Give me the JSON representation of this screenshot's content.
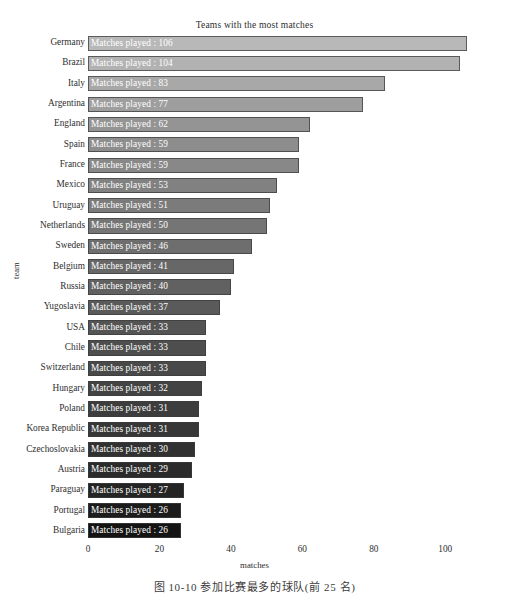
{
  "chart_data": {
    "type": "bar",
    "orientation": "horizontal",
    "title": "Teams with the most matches",
    "xlabel": "matches",
    "ylabel": "team",
    "xlim": [
      0,
      110
    ],
    "xticks": [
      0,
      20,
      40,
      60,
      80,
      100
    ],
    "xtick_labels": [
      "0",
      "20",
      "40",
      "60",
      "80",
      "100"
    ],
    "grid": false,
    "legend": "none",
    "bar_label_prefix": "Matches played  : ",
    "categories": [
      "Germany",
      "Brazil",
      "Italy",
      "Argentina",
      "England",
      "Spain",
      "France",
      "Mexico",
      "Uruguay",
      "Netherlands",
      "Sweden",
      "Belgium",
      "Russia",
      "Yugoslavia",
      "USA",
      "Chile",
      "Switzerland",
      "Hungary",
      "Poland",
      "Korea Republic",
      "Czechoslovakia",
      "Austria",
      "Paraguay",
      "Portugal",
      "Bulgaria"
    ],
    "values": [
      106,
      104,
      83,
      77,
      62,
      59,
      59,
      53,
      51,
      50,
      46,
      41,
      40,
      37,
      33,
      33,
      33,
      32,
      31,
      31,
      30,
      29,
      27,
      26,
      26
    ],
    "bar_labels": [
      "Matches played  : 106",
      "Matches played  : 104",
      "Matches played  : 83",
      "Matches played  : 77",
      "Matches played  : 62",
      "Matches played  : 59",
      "Matches played  : 59",
      "Matches played  : 53",
      "Matches played  : 51",
      "Matches played  : 50",
      "Matches played  : 46",
      "Matches played  : 41",
      "Matches played  : 40",
      "Matches played  : 37",
      "Matches played  : 33",
      "Matches played  : 33",
      "Matches played  : 33",
      "Matches played  : 32",
      "Matches played  : 31",
      "Matches played  : 31",
      "Matches played  : 30",
      "Matches played  : 29",
      "Matches played  : 27",
      "Matches played  : 26",
      "Matches played  : 26"
    ],
    "bar_colors": [
      "#b8b8b8",
      "#b2b2b2",
      "#a8a8a8",
      "#9e9e9e",
      "#949494",
      "#8d8d8d",
      "#888888",
      "#818181",
      "#7b7b7b",
      "#757575",
      "#6e6e6e",
      "#676767",
      "#616161",
      "#5a5a5a",
      "#545454",
      "#4e4e4e",
      "#494949",
      "#434343",
      "#3d3d3d",
      "#373737",
      "#313131",
      "#2b2b2b",
      "#242424",
      "#1c1c1c",
      "#141414"
    ]
  },
  "caption": {
    "text": "图 10-10    参加比赛最多的球队(前 25 名)"
  }
}
